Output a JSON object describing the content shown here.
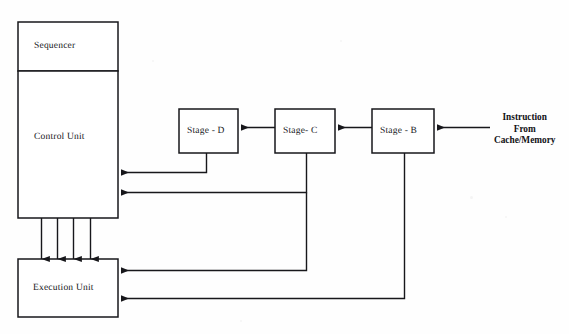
{
  "diagram": {
    "background_color": "#fefefe",
    "line_color": "#17171b",
    "boxes": [
      {
        "id": "sequencer",
        "label": "Sequencer",
        "x": 18,
        "y": 22,
        "w": 100,
        "h": 49,
        "label_x": 34,
        "label_y": 41
      },
      {
        "id": "control-unit",
        "label": "Control Unit",
        "x": 18,
        "y": 71,
        "w": 100,
        "h": 147,
        "label_x": 34,
        "label_y": 132
      },
      {
        "id": "execution-unit",
        "label": "Execution Unit",
        "x": 18,
        "y": 259,
        "w": 100,
        "h": 58,
        "label_x": 33,
        "label_y": 283
      },
      {
        "id": "stage-d",
        "label": "Stage - D",
        "x": 179,
        "y": 109,
        "w": 59,
        "h": 44,
        "label_x": 187,
        "label_y": 126
      },
      {
        "id": "stage-c",
        "label": "Stage- C",
        "x": 275,
        "y": 109,
        "w": 60,
        "h": 44,
        "label_x": 283,
        "label_y": 126
      },
      {
        "id": "stage-b",
        "label": "Stage - B",
        "x": 372,
        "y": 109,
        "w": 62,
        "h": 44,
        "label_x": 380,
        "label_y": 126
      }
    ],
    "source_label": {
      "id": "instruction-source",
      "lines": [
        "Instruction",
        "From",
        "Cache/Memory"
      ],
      "x": 494,
      "y": 112
    },
    "connections": [
      {
        "id": "input-to-stage-b",
        "from": "Instruction source",
        "to": "Stage - B"
      },
      {
        "id": "stage-b-to-stage-c",
        "from": "Stage - B",
        "to": "Stage- C"
      },
      {
        "id": "stage-c-to-stage-d",
        "from": "Stage- C",
        "to": "Stage - D"
      },
      {
        "id": "stage-d-to-control-unit",
        "from": "Stage - D",
        "to": "Control Unit"
      },
      {
        "id": "stage-c-to-control-unit",
        "from": "Stage- C",
        "to": "Control Unit"
      },
      {
        "id": "stage-c-to-execution-unit",
        "from": "Stage- C",
        "to": "Execution Unit"
      },
      {
        "id": "stage-b-to-execution-unit",
        "from": "Stage - B",
        "to": "Execution Unit"
      },
      {
        "id": "control-unit-to-execution-unit-1",
        "from": "Control Unit",
        "to": "Execution Unit"
      },
      {
        "id": "control-unit-to-execution-unit-2",
        "from": "Control Unit",
        "to": "Execution Unit"
      },
      {
        "id": "control-unit-to-execution-unit-3",
        "from": "Control Unit",
        "to": "Execution Unit"
      },
      {
        "id": "control-unit-to-execution-unit-4",
        "from": "Control Unit",
        "to": "Execution Unit"
      }
    ]
  }
}
